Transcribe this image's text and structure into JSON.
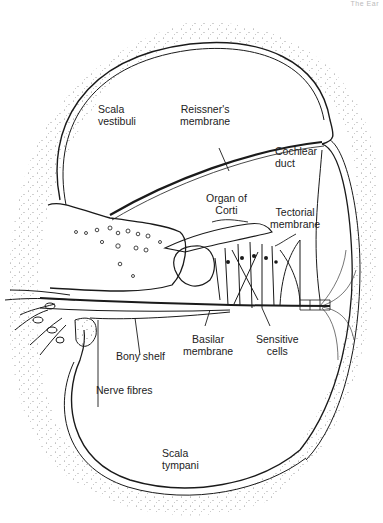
{
  "header": {
    "text": "The Ear"
  },
  "figure": {
    "labels": {
      "scala_vestibuli": [
        "Scala",
        "vestibuli"
      ],
      "reissners_membrane": [
        "Reissner's",
        "membrane"
      ],
      "cochlear_duct": [
        "Cochlear",
        "duct"
      ],
      "organ_of_corti": [
        "Organ of",
        "Corti"
      ],
      "tectorial_membrane": [
        "Tectorial",
        "membrane"
      ],
      "basilar_membrane": [
        "Basilar",
        "membrane"
      ],
      "sensitive_cells": [
        "Sensitive",
        "cells"
      ],
      "bony_shelf": [
        "Bony shelf"
      ],
      "nerve_fibres": [
        "Nerve fibres"
      ],
      "scala_tympani": [
        "Scala",
        "tympani"
      ]
    },
    "colors": {
      "ink": "#1a1a1a",
      "stipple": "#555555",
      "background": "#ffffff"
    }
  }
}
